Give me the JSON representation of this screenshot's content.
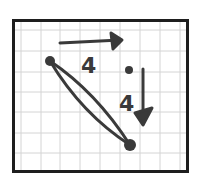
{
  "diagram": {
    "type": "hand-drawn vector diagram on grid paper",
    "colors": {
      "background": "#ffffff",
      "grid": "#d4d4d4",
      "border": "#1e1e1e",
      "ink": "#3a3a3a"
    },
    "frame": {
      "x": 12,
      "y": 19,
      "width": 177,
      "height": 154
    },
    "grid": {
      "vertical_lines_x": [
        21,
        41,
        60,
        80,
        100,
        120,
        140,
        160,
        180
      ],
      "horizontal_lines_y": [
        30,
        51,
        72,
        92,
        112,
        133,
        153
      ]
    },
    "points": [
      {
        "id": "start-point",
        "x": 50,
        "y": 61,
        "r": 5
      },
      {
        "id": "end-point",
        "x": 130,
        "y": 145,
        "r": 6
      },
      {
        "id": "corner-point",
        "x": 129,
        "y": 70,
        "r": 4
      }
    ],
    "arrows": [
      {
        "id": "horizontal-arrow",
        "direction": "right",
        "label": "4"
      },
      {
        "id": "vertical-arrow",
        "direction": "down",
        "label": "4"
      }
    ],
    "labels": {
      "horizontal_distance": "4",
      "vertical_distance": "4"
    }
  }
}
